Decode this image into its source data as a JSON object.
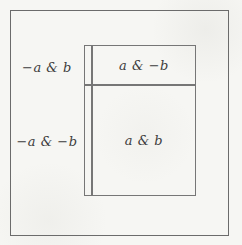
{
  "figure": {
    "background_color": "#f6f6f3",
    "line_color": "#6b6b6b",
    "text_color": "#3d3d3d",
    "regions": {
      "outside_top": "−a & b",
      "inside_top": "a & −b",
      "outside_bottom": "−a & −b",
      "inside_bottom": "a & b"
    }
  }
}
